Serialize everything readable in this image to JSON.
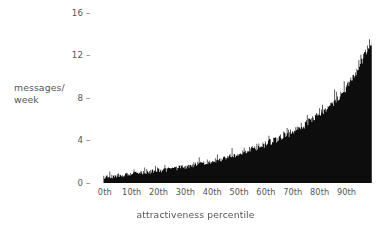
{
  "chart_data": {
    "type": "area",
    "title": "",
    "subtitle": "",
    "xlabel": "attractiveness percentile",
    "ylabel": "messages/\nweek",
    "ylabel_line1": "messages/",
    "ylabel_line2": "week",
    "grid": false,
    "legend": null,
    "xlim": [
      0,
      100
    ],
    "ylim": [
      0,
      16
    ],
    "x_tick_labels": [
      "0th",
      "10th",
      "20th",
      "30th",
      "40th",
      "50th",
      "60th",
      "70th",
      "80th",
      "90th"
    ],
    "x_tick_values": [
      0,
      10,
      20,
      30,
      40,
      50,
      60,
      70,
      80,
      90
    ],
    "y_tick_labels": [
      "16",
      "12",
      "8",
      "4",
      "0"
    ],
    "y_tick_values": [
      16,
      12,
      8,
      4,
      0
    ],
    "tick_dash": "–",
    "series_name": "messages per week",
    "fill_color": "#0d0d0d",
    "text_color": "#555555",
    "background_color": "#ffffff",
    "x": [
      0,
      1,
      2,
      3,
      4,
      5,
      6,
      7,
      8,
      9,
      10,
      11,
      12,
      13,
      14,
      15,
      16,
      17,
      18,
      19,
      20,
      21,
      22,
      23,
      24,
      25,
      26,
      27,
      28,
      29,
      30,
      31,
      32,
      33,
      34,
      35,
      36,
      37,
      38,
      39,
      40,
      41,
      42,
      43,
      44,
      45,
      46,
      47,
      48,
      49,
      50,
      51,
      52,
      53,
      54,
      55,
      56,
      57,
      58,
      59,
      60,
      61,
      62,
      63,
      64,
      65,
      66,
      67,
      68,
      69,
      70,
      71,
      72,
      73,
      74,
      75,
      76,
      77,
      78,
      79,
      80,
      81,
      82,
      83,
      84,
      85,
      86,
      87,
      88,
      89,
      90,
      91,
      92,
      93,
      94,
      95,
      96,
      97,
      98,
      99
    ],
    "values": [
      0.52,
      0.55,
      0.58,
      0.6,
      0.63,
      0.66,
      0.69,
      0.72,
      0.74,
      0.77,
      0.8,
      0.83,
      0.86,
      0.89,
      0.92,
      0.95,
      0.98,
      1.01,
      1.05,
      1.08,
      1.11,
      1.15,
      1.18,
      1.22,
      1.26,
      1.3,
      1.34,
      1.38,
      1.42,
      1.46,
      1.51,
      1.55,
      1.6,
      1.65,
      1.7,
      1.75,
      1.8,
      1.86,
      1.91,
      1.97,
      2.03,
      2.09,
      2.15,
      2.21,
      2.28,
      2.35,
      2.41,
      2.48,
      2.56,
      2.63,
      2.71,
      2.79,
      2.87,
      2.95,
      3.03,
      3.12,
      3.21,
      3.3,
      3.4,
      3.49,
      3.59,
      3.69,
      3.8,
      3.9,
      4.01,
      4.13,
      4.24,
      4.36,
      4.49,
      4.61,
      4.74,
      4.88,
      5.02,
      5.16,
      5.31,
      5.46,
      5.62,
      5.79,
      5.96,
      6.14,
      6.33,
      6.52,
      6.73,
      6.94,
      7.17,
      7.41,
      7.66,
      7.93,
      8.21,
      8.51,
      8.83,
      9.17,
      9.54,
      9.94,
      10.37,
      10.84,
      11.36,
      11.93,
      12.4,
      12.95
    ],
    "noise_amplitude": 0.28
  },
  "axis": {
    "y_axis_name": "messages-per-week-axis",
    "x_axis_name": "attractiveness-percentile-axis"
  }
}
